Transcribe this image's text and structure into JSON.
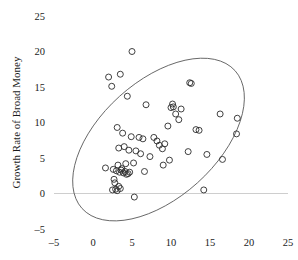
{
  "chart_data": {
    "type": "scatter",
    "title": "",
    "xlabel": "",
    "ylabel": "Growth Rate of Broad Money",
    "xlim": [
      -5,
      25
    ],
    "ylim": [
      -5,
      25
    ],
    "xticks": [
      -5,
      0,
      5,
      10,
      15,
      20,
      25
    ],
    "yticks": [
      -5,
      0,
      5,
      10,
      15,
      20,
      25
    ],
    "xtick_labels": [
      "–5",
      "0",
      "5",
      "10",
      "15",
      "20",
      "25"
    ],
    "ytick_labels": [
      "–5",
      "0",
      "5",
      "10",
      "15",
      "20",
      "25"
    ],
    "grid": false,
    "legend": null,
    "marker": "open-circle",
    "marker_color": "#2b2b2b",
    "zero_line": {
      "y": 0,
      "color": "#c8c8c8"
    },
    "annotations": [
      {
        "kind": "ellipse",
        "label": "concentration-ellipse",
        "center_x": 8.4,
        "center_y": 7.6,
        "semi_major": 13.2,
        "semi_minor": 8.2,
        "rotation_deg": -42,
        "color": "#5a5a5a"
      }
    ],
    "x": [
      5.0,
      2.0,
      3.5,
      2.4,
      12.4,
      12.6,
      4.4,
      6.8,
      10.2,
      10.3,
      11.3,
      10.6,
      16.3,
      3.1,
      10.0,
      11.0,
      18.5,
      13.2,
      13.6,
      9.6,
      3.8,
      4.9,
      5.9,
      6.4,
      7.8,
      8.2,
      18.4,
      3.3,
      4.0,
      4.6,
      5.5,
      6.1,
      8.5,
      9.2,
      3.2,
      4.2,
      5.2,
      12.2,
      14.6,
      7.3,
      8.9,
      9.8,
      16.6,
      9.0,
      1.6,
      2.6,
      3.0,
      3.4,
      3.6,
      3.7,
      3.9,
      4.1,
      4.3,
      4.5,
      4.7,
      6.6,
      2.7,
      2.8,
      3.3,
      3.5,
      2.5,
      2.9,
      3.1,
      14.2,
      5.3
    ],
    "y": [
      20.0,
      16.4,
      16.8,
      15.1,
      15.6,
      15.5,
      13.7,
      12.5,
      12.6,
      12.2,
      11.9,
      11.2,
      11.2,
      9.3,
      12.1,
      10.4,
      10.6,
      9.0,
      8.9,
      9.5,
      8.5,
      8.0,
      7.9,
      7.7,
      7.9,
      7.4,
      8.4,
      6.4,
      6.6,
      6.1,
      6.0,
      5.6,
      6.8,
      7.0,
      4.0,
      4.2,
      4.3,
      5.9,
      5.5,
      5.2,
      6.3,
      4.7,
      4.8,
      4.0,
      3.6,
      3.4,
      3.2,
      3.0,
      3.3,
      3.5,
      2.9,
      3.1,
      2.7,
      2.8,
      3.0,
      3.1,
      2.0,
      1.5,
      1.0,
      0.7,
      0.5,
      0.6,
      0.4,
      0.5,
      -0.5
    ]
  }
}
